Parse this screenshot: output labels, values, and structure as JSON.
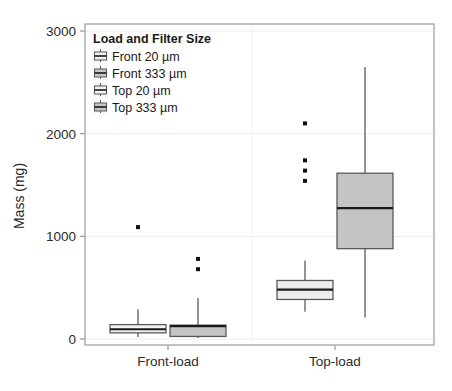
{
  "chart_data": {
    "type": "box",
    "title": "",
    "xlabel": "",
    "ylabel": "Mass (mg)",
    "ylim": [
      0,
      3100
    ],
    "yticks": [
      0,
      1000,
      2000,
      3000
    ],
    "ytick_labels": [
      "0",
      "1000",
      "2000",
      "3000"
    ],
    "categories": [
      "Front-load",
      "Top-load"
    ],
    "grid": "horizontal-light",
    "legend": {
      "title": "Load and Filter Size",
      "position": "top-left-inside",
      "entries": [
        {
          "label": "Front 20 µm",
          "fill": "#f2f2f2"
        },
        {
          "label": "Front 333 µm",
          "fill": "#c4c4c4"
        },
        {
          "label": "Top 20 µm",
          "fill": "#f2f2f2"
        },
        {
          "label": "Top 333 µm",
          "fill": "#c4c4c4"
        }
      ]
    },
    "series": [
      {
        "name": "Front 20 µm",
        "category": "Front-load",
        "fill": "#f4f4f4",
        "stats": {
          "whisker_low": 20,
          "q1": 60,
          "median": 95,
          "q3": 140,
          "whisker_high": 290
        },
        "outliers": [
          1090
        ]
      },
      {
        "name": "Front 333 µm",
        "category": "Front-load",
        "fill": "#c4c4c4",
        "stats": {
          "whisker_low": 10,
          "q1": 25,
          "median": 125,
          "q3": 135,
          "whisker_high": 400
        },
        "outliers": [
          680,
          780
        ]
      },
      {
        "name": "Top 20 µm",
        "category": "Top-load",
        "fill": "#ededed",
        "stats": {
          "whisker_low": 265,
          "q1": 385,
          "median": 480,
          "q3": 570,
          "whisker_high": 765
        },
        "outliers": [
          1540,
          1640,
          1740,
          2100
        ]
      },
      {
        "name": "Top 333 µm",
        "category": "Top-load",
        "fill": "#c4c4c4",
        "stats": {
          "whisker_low": 210,
          "q1": 880,
          "median": 1275,
          "q3": 1615,
          "whisker_high": 2650
        },
        "outliers": []
      }
    ]
  },
  "colors": {
    "light_fill": "#f4f4f4",
    "dark_fill": "#c4c4c4",
    "box_stroke": "#595959",
    "median_stroke": "#1a1a1a",
    "axis": "#9a9a9a",
    "grid": "#ececec",
    "text": "#2b2b2b",
    "outlier": "#111111"
  },
  "geometry": {
    "plot": {
      "left": 85,
      "right": 434,
      "top": 24,
      "bottom": 345
    },
    "y_pixel": {
      "v0": 339,
      "v3000": 31
    },
    "category_ticks": [
      168,
      335
    ],
    "box_half_width": 28,
    "box_offset": 30
  }
}
